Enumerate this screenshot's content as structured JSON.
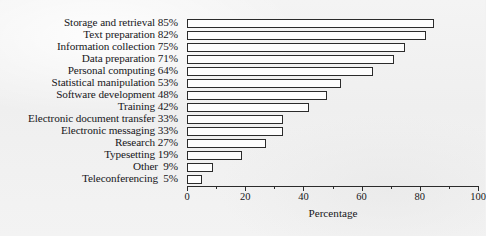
{
  "chart_data": {
    "type": "bar",
    "orientation": "horizontal",
    "title": "",
    "xlabel": "Percentage",
    "ylabel": "",
    "xlim": [
      0,
      100
    ],
    "xticks": [
      0,
      20,
      40,
      60,
      80,
      100
    ],
    "xtick_labels": [
      "0",
      "20",
      "40",
      "60",
      "80",
      "100"
    ],
    "minor_xticks": [
      10,
      30,
      50,
      70,
      90
    ],
    "grid": false,
    "legend": null,
    "bar_style": {
      "fill": "#fdfdfd",
      "edge": "#2b2b2b"
    },
    "categories": [
      "Storage and retrieval",
      "Text preparation",
      "Information collection",
      "Data preparation",
      "Personal computing",
      "Statistical manipulation",
      "Software development",
      "Training",
      "Electronic document transfer",
      "Electronic messaging",
      "Research",
      "Typesetting",
      "Other",
      "Teleconferencing"
    ],
    "values": [
      85,
      82,
      75,
      71,
      64,
      53,
      48,
      42,
      33,
      33,
      27,
      19,
      9,
      5
    ],
    "category_labels": [
      "Storage and retrieval 85%",
      "Text preparation 82%",
      "Information collection 75%",
      "Data preparation 71%",
      "Personal computing 64%",
      "Statistical manipulation 53%",
      "Software development 48%",
      "Training 42%",
      "Electronic document transfer 33%",
      "Electronic messaging 33%",
      "Research 27%",
      "Typesetting 19%",
      "Other  9%",
      "Teleconferencing  5%"
    ]
  }
}
